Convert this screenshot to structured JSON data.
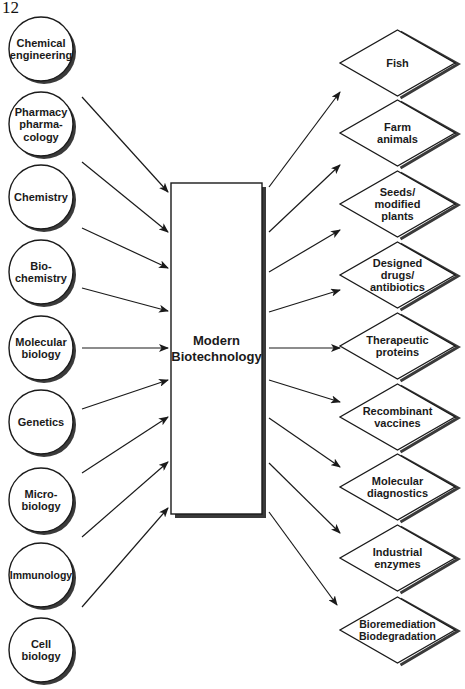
{
  "page_number": "12",
  "center": {
    "label_lines": [
      "Modern",
      "Biotechnology"
    ]
  },
  "inputs": [
    {
      "id": "chemical-engineering",
      "lines": [
        "Chemical",
        "engineering"
      ]
    },
    {
      "id": "pharmacy-pharmacology",
      "lines": [
        "Pharmacy",
        "pharma-",
        "cology"
      ]
    },
    {
      "id": "chemistry",
      "lines": [
        "Chemistry"
      ]
    },
    {
      "id": "biochemistry",
      "lines": [
        "Bio-",
        "chemistry"
      ]
    },
    {
      "id": "molecular-biology",
      "lines": [
        "Molecular",
        "biology"
      ]
    },
    {
      "id": "genetics",
      "lines": [
        "Genetics"
      ]
    },
    {
      "id": "microbiology",
      "lines": [
        "Micro-",
        "biology"
      ]
    },
    {
      "id": "immunology",
      "lines": [
        "Immunology"
      ]
    },
    {
      "id": "cell-biology",
      "lines": [
        "Cell",
        "biology"
      ]
    }
  ],
  "outputs": [
    {
      "id": "fish",
      "lines": [
        "Fish"
      ]
    },
    {
      "id": "farm-animals",
      "lines": [
        "Farm",
        "animals"
      ]
    },
    {
      "id": "seeds-modified-plants",
      "lines": [
        "Seeds/",
        "modified",
        "plants"
      ]
    },
    {
      "id": "designed-drugs-antibiotics",
      "lines": [
        "Designed",
        "drugs/",
        "antibiotics"
      ]
    },
    {
      "id": "therapeutic-proteins",
      "lines": [
        "Therapeutic",
        "proteins"
      ]
    },
    {
      "id": "recombinant-vaccines",
      "lines": [
        "Recombinant",
        "vaccines"
      ]
    },
    {
      "id": "molecular-diagnostics",
      "lines": [
        "Molecular",
        "diagnostics"
      ]
    },
    {
      "id": "industrial-enzymes",
      "lines": [
        "Industrial",
        "enzymes"
      ]
    },
    {
      "id": "bioremediation-biodegradation",
      "lines": [
        "Bioremediation",
        "Biodegradation"
      ]
    }
  ],
  "colors": {
    "stroke": "#1a1a1a",
    "shadow": "#3a3a3a",
    "fill": "#ffffff"
  }
}
